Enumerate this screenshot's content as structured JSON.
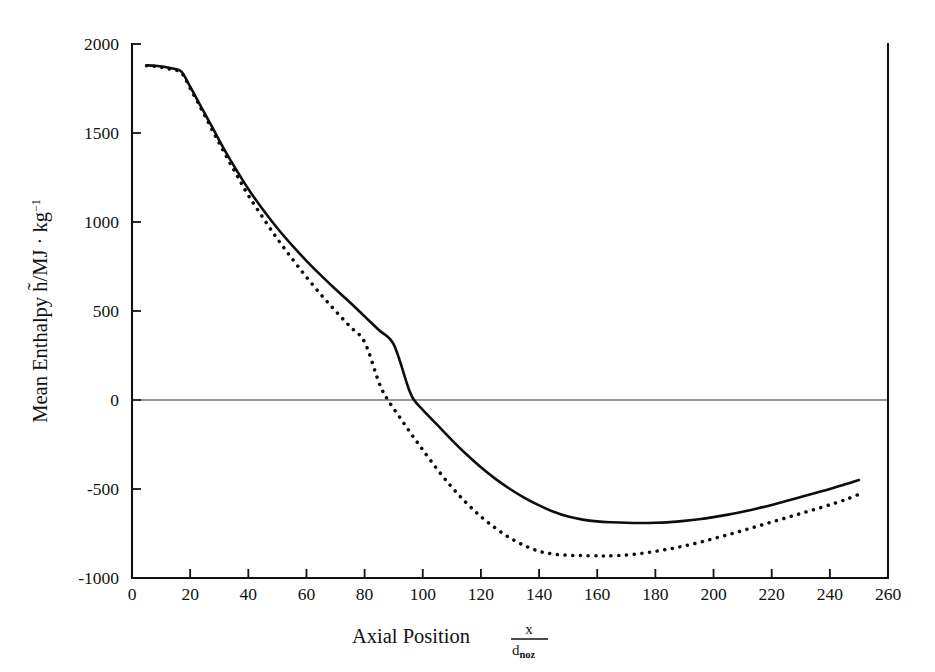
{
  "figure": {
    "background_color": "#ffffff",
    "ink_color": "#111111"
  },
  "chart_data": {
    "type": "line",
    "title": "",
    "xlabel": "Axial Position",
    "xlabel_fraction_numerator": "x",
    "xlabel_fraction_denominator_base": "d",
    "xlabel_fraction_denominator_sub": "noz",
    "ylabel_prefix": "Mean Enthalpy",
    "ylabel_symbol": "h̃",
    "ylabel_units": "/MJ · kg",
    "ylabel_units_exponent": "−1",
    "ylabel_full": "Mean Enthalpy h̃/MJ · kg⁻¹",
    "xlim": [
      0,
      260
    ],
    "ylim": [
      -1000,
      2000
    ],
    "xticks": [
      0,
      20,
      40,
      60,
      80,
      100,
      120,
      140,
      160,
      180,
      200,
      220,
      240,
      260
    ],
    "yticks": [
      -1000,
      -500,
      0,
      500,
      1000,
      1500,
      2000
    ],
    "xticklabels": [
      "0",
      "20",
      "40",
      "60",
      "80",
      "100",
      "120",
      "140",
      "160",
      "180",
      "200",
      "220",
      "240",
      "260"
    ],
    "yticklabels": [
      "-1000",
      "-500",
      "0",
      "500",
      "1000",
      "1500",
      "2000"
    ],
    "grid": false,
    "legend": "none",
    "zero_reference_line": 0,
    "series": [
      {
        "name": "solid",
        "style": "solid",
        "color": "#0d0d0d",
        "x": [
          5,
          8,
          11,
          14,
          17,
          20,
          24,
          28,
          32,
          36,
          40,
          45,
          50,
          55,
          60,
          65,
          70,
          75,
          80,
          85,
          90,
          95,
          97,
          100,
          105,
          110,
          115,
          120,
          125,
          130,
          135,
          140,
          145,
          150,
          155,
          160,
          165,
          170,
          175,
          180,
          185,
          190,
          195,
          200,
          205,
          210,
          215,
          220,
          225,
          230,
          235,
          240,
          245,
          250
        ],
        "y": [
          1880,
          1878,
          1872,
          1862,
          1845,
          1760,
          1640,
          1520,
          1400,
          1290,
          1185,
          1070,
          965,
          870,
          782,
          700,
          622,
          548,
          470,
          392,
          312,
          70,
          0,
          -55,
          -140,
          -225,
          -305,
          -378,
          -443,
          -500,
          -550,
          -592,
          -628,
          -655,
          -672,
          -682,
          -687,
          -690,
          -691,
          -690,
          -686,
          -679,
          -670,
          -658,
          -644,
          -628,
          -610,
          -590,
          -568,
          -545,
          -522,
          -500,
          -475,
          -450
        ]
      },
      {
        "name": "dotted",
        "style": "dotted",
        "color": "#0d0d0d",
        "x": [
          5,
          8,
          11,
          14,
          17,
          20,
          24,
          28,
          32,
          36,
          40,
          45,
          50,
          55,
          60,
          65,
          70,
          75,
          80,
          85,
          88,
          92,
          96,
          100,
          105,
          110,
          115,
          120,
          125,
          130,
          135,
          140,
          145,
          150,
          155,
          160,
          163,
          167,
          172,
          177,
          182,
          187,
          192,
          197,
          202,
          207,
          212,
          217,
          222,
          227,
          232,
          237,
          242,
          246,
          250
        ],
        "y": [
          1878,
          1874,
          1866,
          1855,
          1838,
          1752,
          1630,
          1505,
          1382,
          1265,
          1150,
          1025,
          905,
          795,
          690,
          592,
          500,
          412,
          325,
          95,
          0,
          -95,
          -190,
          -280,
          -390,
          -490,
          -578,
          -655,
          -720,
          -775,
          -818,
          -850,
          -866,
          -872,
          -874,
          -875,
          -876,
          -874,
          -868,
          -858,
          -845,
          -830,
          -812,
          -792,
          -770,
          -748,
          -724,
          -700,
          -676,
          -652,
          -628,
          -604,
          -578,
          -556,
          -530
        ]
      }
    ]
  },
  "geometry": {
    "plot_left": 132,
    "plot_right": 888,
    "plot_top": 44,
    "plot_bottom": 578
  }
}
